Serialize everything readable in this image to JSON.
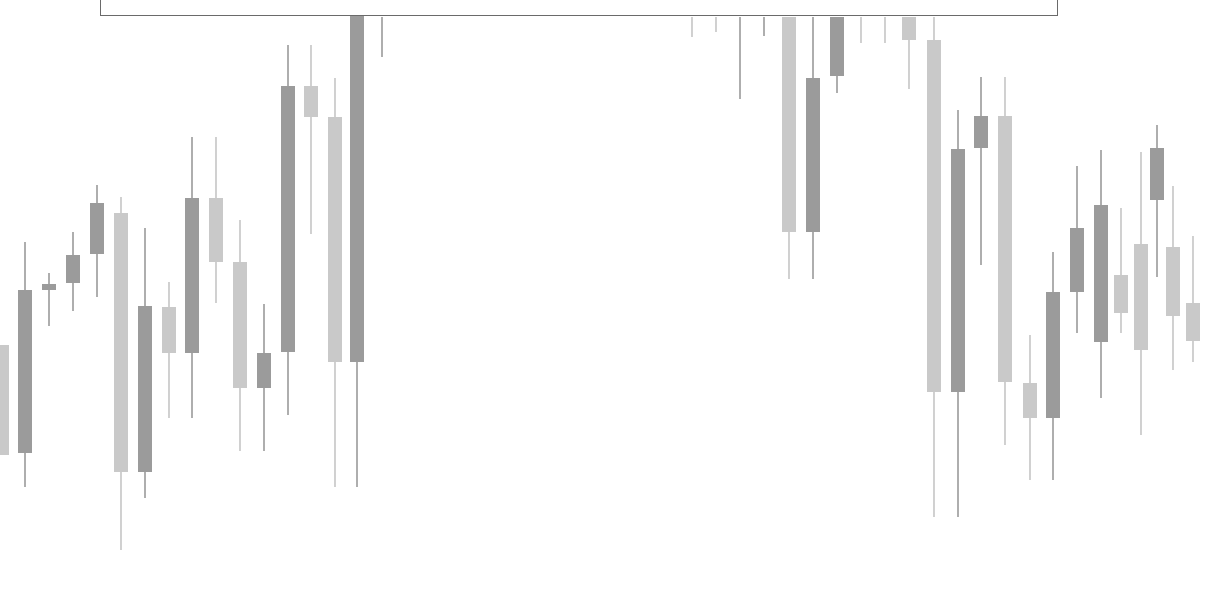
{
  "colors": {
    "dark": "#9b9b9b",
    "light": "#c9c9c9",
    "wick_dark": "#8c8c8c",
    "wick_light": "#bdbdbd",
    "box_border": "#6a6a6a"
  },
  "chart_data": {
    "type": "candlestick",
    "title": "",
    "xlabel": "",
    "ylabel": "",
    "grid": false,
    "legend": null,
    "note": "Values expressed in screen pixel coordinates (y increases downward); no axes/labels visible.",
    "candle_width": 14,
    "candles": [
      {
        "x": 2,
        "high": 345,
        "top": 345,
        "bottom": 455,
        "low": 455,
        "tone": "light"
      },
      {
        "x": 25,
        "high": 242,
        "top": 290,
        "bottom": 453,
        "low": 487,
        "tone": "dark"
      },
      {
        "x": 49,
        "high": 273,
        "top": 284,
        "bottom": 290,
        "low": 326,
        "tone": "dark"
      },
      {
        "x": 73,
        "high": 232,
        "top": 255,
        "bottom": 283,
        "low": 311,
        "tone": "dark"
      },
      {
        "x": 97,
        "high": 185,
        "top": 203,
        "bottom": 254,
        "low": 297,
        "tone": "dark"
      },
      {
        "x": 121,
        "high": 197,
        "top": 213,
        "bottom": 472,
        "low": 550,
        "tone": "light"
      },
      {
        "x": 145,
        "high": 228,
        "top": 306,
        "bottom": 472,
        "low": 498,
        "tone": "dark"
      },
      {
        "x": 169,
        "high": 282,
        "top": 307,
        "bottom": 353,
        "low": 418,
        "tone": "light"
      },
      {
        "x": 192,
        "high": 137,
        "top": 198,
        "bottom": 353,
        "low": 418,
        "tone": "dark"
      },
      {
        "x": 216,
        "high": 137,
        "top": 198,
        "bottom": 262,
        "low": 303,
        "tone": "light"
      },
      {
        "x": 240,
        "high": 220,
        "top": 262,
        "bottom": 388,
        "low": 451,
        "tone": "light"
      },
      {
        "x": 264,
        "high": 304,
        "top": 353,
        "bottom": 388,
        "low": 451,
        "tone": "dark"
      },
      {
        "x": 288,
        "high": 45,
        "top": 86,
        "bottom": 352,
        "low": 415,
        "tone": "dark"
      },
      {
        "x": 311,
        "high": 45,
        "top": 86,
        "bottom": 117,
        "low": 234,
        "tone": "light"
      },
      {
        "x": 335,
        "high": 78,
        "top": 117,
        "bottom": 362,
        "low": 487,
        "tone": "light"
      },
      {
        "x": 357,
        "high": 0,
        "top": 0,
        "bottom": 362,
        "low": 487,
        "tone": "dark"
      },
      {
        "x": 382,
        "high": 17,
        "top": 17,
        "bottom": 17,
        "low": 57,
        "tone": "dark",
        "wick_only": true
      },
      {
        "x": 692,
        "high": 17,
        "top": 17,
        "bottom": 17,
        "low": 37,
        "tone": "light",
        "wick_only": true
      },
      {
        "x": 716,
        "high": 17,
        "top": 17,
        "bottom": 17,
        "low": 32,
        "tone": "light",
        "wick_only": true
      },
      {
        "x": 740,
        "high": 17,
        "top": 17,
        "bottom": 17,
        "low": 99,
        "tone": "dark",
        "wick_only": true
      },
      {
        "x": 764,
        "high": 17,
        "top": 17,
        "bottom": 17,
        "low": 36,
        "tone": "dark",
        "wick_only": true
      },
      {
        "x": 789,
        "high": 17,
        "top": 17,
        "bottom": 232,
        "low": 279,
        "tone": "light"
      },
      {
        "x": 813,
        "high": 17,
        "top": 78,
        "bottom": 232,
        "low": 279,
        "tone": "dark"
      },
      {
        "x": 837,
        "high": 17,
        "top": 17,
        "bottom": 76,
        "low": 93,
        "tone": "dark"
      },
      {
        "x": 861,
        "high": 17,
        "top": 17,
        "bottom": 17,
        "low": 43,
        "tone": "light",
        "wick_only": true
      },
      {
        "x": 885,
        "high": 17,
        "top": 17,
        "bottom": 17,
        "low": 43,
        "tone": "light",
        "wick_only": true
      },
      {
        "x": 909,
        "high": 17,
        "top": 17,
        "bottom": 40,
        "low": 89,
        "tone": "light"
      },
      {
        "x": 934,
        "high": 17,
        "top": 40,
        "bottom": 392,
        "low": 517,
        "tone": "light"
      },
      {
        "x": 958,
        "high": 110,
        "top": 149,
        "bottom": 392,
        "low": 517,
        "tone": "dark"
      },
      {
        "x": 981,
        "high": 77,
        "top": 116,
        "bottom": 148,
        "low": 265,
        "tone": "dark"
      },
      {
        "x": 1005,
        "high": 77,
        "top": 116,
        "bottom": 382,
        "low": 445,
        "tone": "light"
      },
      {
        "x": 1030,
        "high": 335,
        "top": 383,
        "bottom": 418,
        "low": 480,
        "tone": "light"
      },
      {
        "x": 1053,
        "high": 252,
        "top": 292,
        "bottom": 418,
        "low": 480,
        "tone": "dark"
      },
      {
        "x": 1077,
        "high": 166,
        "top": 228,
        "bottom": 292,
        "low": 333,
        "tone": "dark"
      },
      {
        "x": 1101,
        "high": 150,
        "top": 205,
        "bottom": 342,
        "low": 398,
        "tone": "dark"
      },
      {
        "x": 1121,
        "high": 208,
        "top": 275,
        "bottom": 313,
        "low": 333,
        "tone": "light"
      },
      {
        "x": 1141,
        "high": 152,
        "top": 244,
        "bottom": 350,
        "low": 435,
        "tone": "light"
      },
      {
        "x": 1157,
        "high": 125,
        "top": 148,
        "bottom": 200,
        "low": 277,
        "tone": "dark"
      },
      {
        "x": 1173,
        "high": 186,
        "top": 247,
        "bottom": 316,
        "low": 370,
        "tone": "light"
      },
      {
        "x": 1193,
        "high": 236,
        "top": 303,
        "bottom": 341,
        "low": 362,
        "tone": "light"
      }
    ]
  }
}
